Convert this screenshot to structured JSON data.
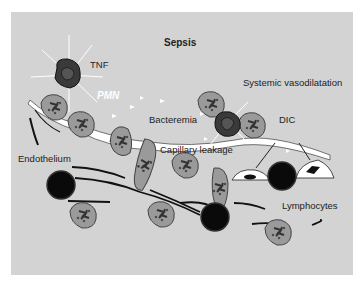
{
  "diagram": {
    "title": "Sepsis",
    "labels": {
      "tnf": "TNF",
      "pmn": "PMN",
      "bacteremia": "Bacteremia",
      "systemic_vasodilatation": "Systemic vasodilatation",
      "dic": "DIC",
      "endothelium": "Endothelium",
      "capillary_leakage": "Capillary leakage",
      "lymphocytes": "Lymphocytes"
    },
    "colors": {
      "background": "#d3d3d3",
      "cell_fill": "#9a9a9a",
      "activated_cell": "#3a3a3a",
      "lymphocyte": "#111111",
      "endothelium": "#ffffff"
    }
  }
}
